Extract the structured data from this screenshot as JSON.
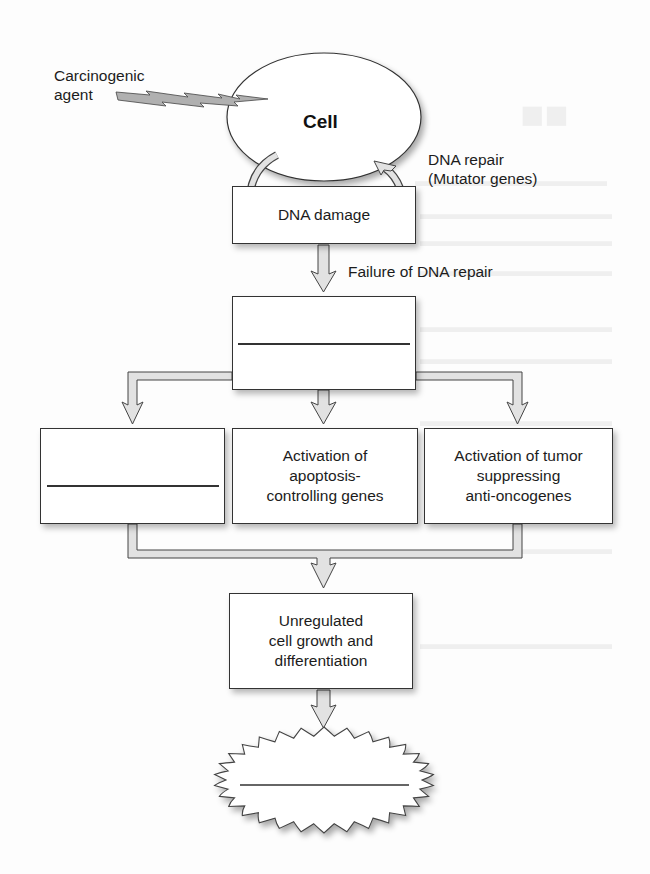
{
  "diagram": {
    "type": "flowchart",
    "title": "",
    "agent_label": [
      "Carcinogenic",
      "agent"
    ],
    "cell_label": "Cell",
    "dna_repair_label": [
      "DNA repair",
      "(Mutator genes)"
    ],
    "dna_damage_label": "DNA damage",
    "failure_label": "Failure of DNA repair",
    "step2_blank": "",
    "branches": [
      {
        "id": "left",
        "lines": [],
        "blank": true
      },
      {
        "id": "middle",
        "lines": [
          "Activation of",
          "apoptosis-",
          "controlling genes"
        ],
        "blank": false
      },
      {
        "id": "right",
        "lines": [
          "Activation of tumor",
          "suppressing",
          "anti-oncogenes"
        ],
        "blank": false
      }
    ],
    "unregulated_label": [
      "Unregulated",
      "cell growth and",
      "differentiation"
    ],
    "final_blank": "",
    "colors": {
      "outline": "#333333",
      "arrow_fill": "#e2e2e2",
      "bolt_fill": "#b0b0b0",
      "background": "#fdfdfd"
    }
  }
}
